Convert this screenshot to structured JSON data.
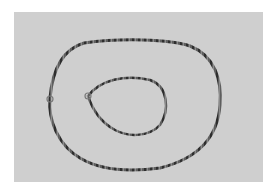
{
  "image": {
    "description": "Photograph of two beaded necklaces laid flat on a light gray surface: a large outer oval loop and a smaller inner teardrop-shaped loop.",
    "colors": {
      "border": "#ffffff",
      "background": "#cfcfcf",
      "strand": "#5a5a5a",
      "bead_dark": "#2e2e2e"
    },
    "objects": [
      {
        "name": "outer-necklace",
        "shape": "oval loop"
      },
      {
        "name": "inner-necklace",
        "shape": "teardrop loop"
      }
    ]
  }
}
